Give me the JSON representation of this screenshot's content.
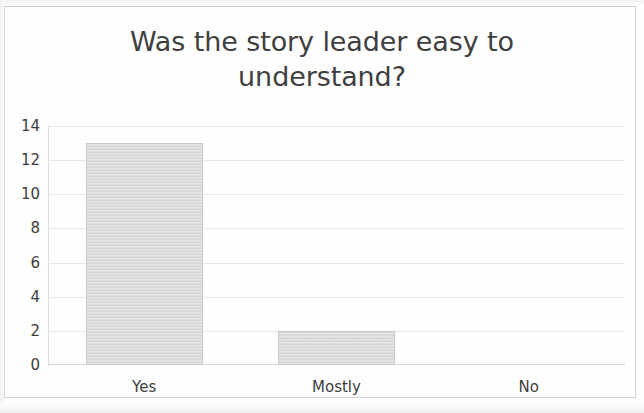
{
  "page": {
    "background_color": "#fefefe",
    "frame_color": "#d2d2d2"
  },
  "chart_data": {
    "type": "bar",
    "title": "Was the story leader easy to understand?",
    "title_lines": [
      "Was the story leader easy to",
      "understand?"
    ],
    "categories": [
      "Yes",
      "Mostly",
      "No"
    ],
    "values": [
      13,
      2,
      0
    ],
    "xlabel": "",
    "ylabel": "",
    "ylim": [
      0,
      14
    ],
    "y_ticks": [
      0,
      2,
      4,
      6,
      8,
      10,
      12,
      14
    ],
    "y_tick_labels": [
      "0",
      "2",
      "4",
      "6",
      "8",
      "10",
      "12",
      "14"
    ],
    "grid": true,
    "legend": false,
    "legend_position": "none",
    "series": [
      {
        "name": "Responses",
        "values": [
          13,
          2,
          0
        ],
        "color": "#dadada",
        "border_color": "#c8c8c8"
      }
    ],
    "title_color": "#3f3f3f",
    "tick_label_color": "#3d3d3d",
    "gridline_color": "#e8e8e8",
    "axis_line_color": "#dcdcdc"
  }
}
